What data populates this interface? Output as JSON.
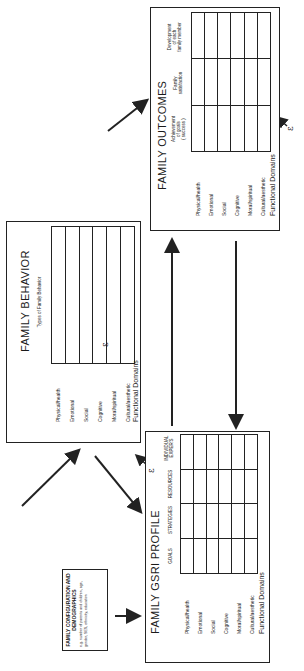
{
  "orientation": "rotated 90 degrees counter-clockwise",
  "config_box": {
    "title": "FAMILY CONFIGURATION AND DEMOGRAPHICS",
    "note": "e.g. number of parents and children, age, gender, SES, ethnicity, education"
  },
  "gsri": {
    "title": "FAMILY GSRI PROFILE",
    "axis_label": "Functional Domains",
    "columns": [
      "GOALS",
      "STRATEGIES",
      "RESOURCES",
      "INDIVIDUAL\nEXPER'S"
    ],
    "rows": [
      "Physical/health",
      "Emotional",
      "Social",
      "Cognitive",
      "Moral/spiritual",
      "Cultural/aesthetic"
    ],
    "epsilon": "ε"
  },
  "behavior": {
    "title": "FAMILY BEHAVIOR",
    "axis_label": "Functional Domains",
    "column_header": "Types of Family Behavior",
    "rows": [
      "Physical/health",
      "Emotional",
      "Social",
      "Cognitive",
      "Moral/spiritual",
      "Cultural/aesthetic"
    ],
    "epsilon": "ε"
  },
  "outcomes": {
    "title": "FAMILY OUTCOMES",
    "axis_label": "Functional Domains",
    "columns": [
      "Achievement\nof goals\n( success )",
      "Family\nsatisfaction",
      "Development\nof each\nfamily member"
    ],
    "rows": [
      "Physical/health",
      "Emotional",
      "Social",
      "Cognitive",
      "Moral/spiritual",
      "Cultural/aesthetic"
    ],
    "epsilon": "ε"
  },
  "arrows": [
    {
      "from": "config_box",
      "to": "gsri"
    },
    {
      "from": "gsri",
      "to": "behavior"
    },
    {
      "from": "behavior",
      "to": "gsri"
    },
    {
      "from": "behavior",
      "to": "outcomes"
    },
    {
      "from": "gsri",
      "to": "outcomes"
    },
    {
      "from": "outcomes",
      "to": "gsri"
    }
  ]
}
